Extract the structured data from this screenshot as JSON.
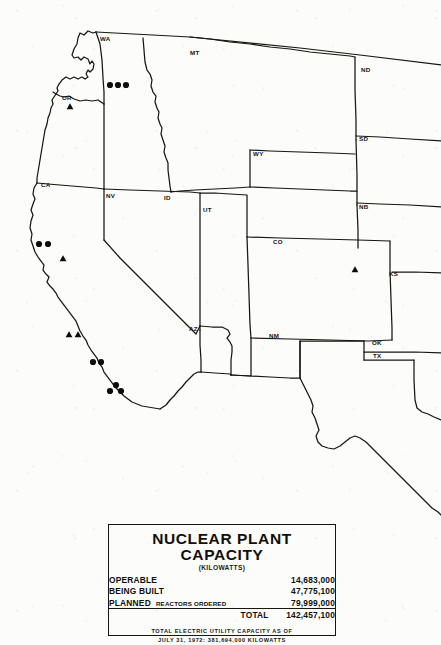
{
  "map": {
    "title_alt": "Western United States nuclear plant location map",
    "state_labels": [
      {
        "code": "WA",
        "x": 100,
        "y": 40
      },
      {
        "code": "MT",
        "x": 190,
        "y": 54
      },
      {
        "code": "ND",
        "x": 362,
        "y": 71
      },
      {
        "code": "OR",
        "x": 63,
        "y": 99
      },
      {
        "code": "SD",
        "x": 360,
        "y": 140
      },
      {
        "code": "WY",
        "x": 254,
        "y": 155
      },
      {
        "code": "CA",
        "x": 42,
        "y": 186
      },
      {
        "code": "NV",
        "x": 106,
        "y": 197
      },
      {
        "code": "ID",
        "x": 164,
        "y": 199
      },
      {
        "code": "NB",
        "x": 360,
        "y": 208
      },
      {
        "code": "UT",
        "x": 204,
        "y": 211
      },
      {
        "code": "CO",
        "x": 274,
        "y": 243
      },
      {
        "code": "KS",
        "x": 389,
        "y": 275
      },
      {
        "code": "AZ",
        "x": 190,
        "y": 330
      },
      {
        "code": "NM",
        "x": 270,
        "y": 337
      },
      {
        "code": "OK",
        "x": 373,
        "y": 344
      },
      {
        "code": "TX",
        "x": 374,
        "y": 357
      }
    ],
    "markers": [
      {
        "type": "circle",
        "state": "WA",
        "x": 110,
        "y": 85
      },
      {
        "type": "circle",
        "state": "WA",
        "x": 118,
        "y": 85
      },
      {
        "type": "circle",
        "state": "WA",
        "x": 126,
        "y": 85
      },
      {
        "type": "triangle",
        "state": "OR",
        "x": 70,
        "y": 107
      },
      {
        "type": "circle",
        "state": "CA",
        "x": 39,
        "y": 244
      },
      {
        "type": "circle",
        "state": "CA",
        "x": 48,
        "y": 244
      },
      {
        "type": "triangle",
        "state": "CA",
        "x": 63,
        "y": 259
      },
      {
        "type": "triangle",
        "state": "CA",
        "x": 69,
        "y": 335
      },
      {
        "type": "triangle",
        "state": "CA",
        "x": 78,
        "y": 335
      },
      {
        "type": "circle",
        "state": "CA",
        "x": 93,
        "y": 362
      },
      {
        "type": "circle",
        "state": "CA",
        "x": 101,
        "y": 362
      },
      {
        "type": "circle",
        "state": "CA",
        "x": 116,
        "y": 385
      },
      {
        "type": "circle",
        "state": "CA",
        "x": 110,
        "y": 391
      },
      {
        "type": "circle",
        "state": "CA",
        "x": 121,
        "y": 391
      },
      {
        "type": "triangle",
        "state": "CO",
        "x": 355,
        "y": 270
      }
    ],
    "marker_legend": {
      "circle_meaning": "circle-marker",
      "triangle_meaning": "triangle-marker"
    },
    "ink_color": "#17160f",
    "paper_color": "#fcfcfa"
  },
  "panel": {
    "title": "NUCLEAR PLANT CAPACITY",
    "units": "(KILOWATTS)",
    "rows": [
      {
        "label": "OPERABLE",
        "note": "",
        "value": "14,683,000"
      },
      {
        "label": "BEING BUILT",
        "note": "",
        "value": "47,775,100"
      },
      {
        "label": "PLANNED",
        "note": "REACTORS ORDERED",
        "value": "79,999,000"
      }
    ],
    "total": {
      "label": "TOTAL",
      "value": "142,457,100"
    },
    "footnote_line1": "TOTAL ELECTRIC UTILITY CAPACITY AS OF",
    "footnote_line2": "JULY 31, 1972: 381,694,000 KILOWATTS"
  }
}
